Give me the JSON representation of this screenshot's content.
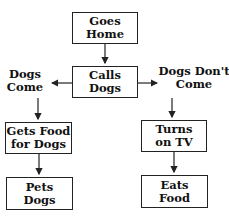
{
  "diagram": {
    "type": "flowchart",
    "nodes": {
      "goes_home": {
        "line1": "Goes",
        "line2": "Home"
      },
      "calls_dogs": {
        "line1": "Calls",
        "line2": "Dogs"
      },
      "gets_food": {
        "line1": "Gets Food",
        "line2": "for Dogs"
      },
      "pets_dogs": {
        "line1": "Pets",
        "line2": "Dogs"
      },
      "turns_on_tv": {
        "line1": "Turns",
        "line2": "on TV"
      },
      "eats_food": {
        "line1": "Eats",
        "line2": "Food"
      }
    },
    "branches": {
      "left": {
        "line1": "Dogs",
        "line2": "Come"
      },
      "right": {
        "line1": "Dogs Don't",
        "line2": "Come"
      }
    },
    "edges": [
      [
        "Goes Home",
        "Calls Dogs"
      ],
      [
        "Calls Dogs",
        "Dogs Come"
      ],
      [
        "Calls Dogs",
        "Dogs Don't Come"
      ],
      [
        "Dogs Come",
        "Gets Food for Dogs"
      ],
      [
        "Gets Food for Dogs",
        "Pets Dogs"
      ],
      [
        "Dogs Don't Come",
        "Turns on TV"
      ],
      [
        "Turns on TV",
        "Eats Food"
      ]
    ]
  }
}
